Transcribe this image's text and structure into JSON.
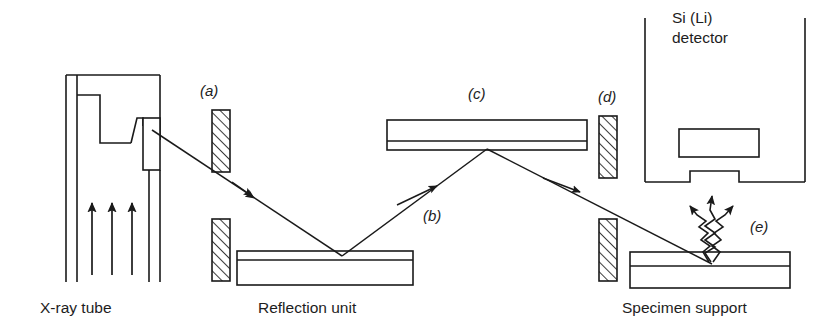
{
  "figure": {
    "type": "diagram",
    "background": "#ffffff",
    "stroke_color": "#1a1a1a",
    "hatch_color": "#1a1a1a"
  },
  "captions": {
    "xray_tube": "X-ray tube",
    "reflection_unit": "Reflection unit",
    "specimen_support": "Specimen support"
  },
  "detector": {
    "line1": "Si (Li)",
    "line2": "detector"
  },
  "part_labels": {
    "a": "(a)",
    "b": "(b)",
    "c": "(c)",
    "d": "(d)",
    "e": "(e)"
  },
  "components": {
    "electron_arrows": 3,
    "collimator_slits": 2,
    "collimator_blocks": 4,
    "fluorescence_arrows": 3,
    "beam_segments": 3
  }
}
